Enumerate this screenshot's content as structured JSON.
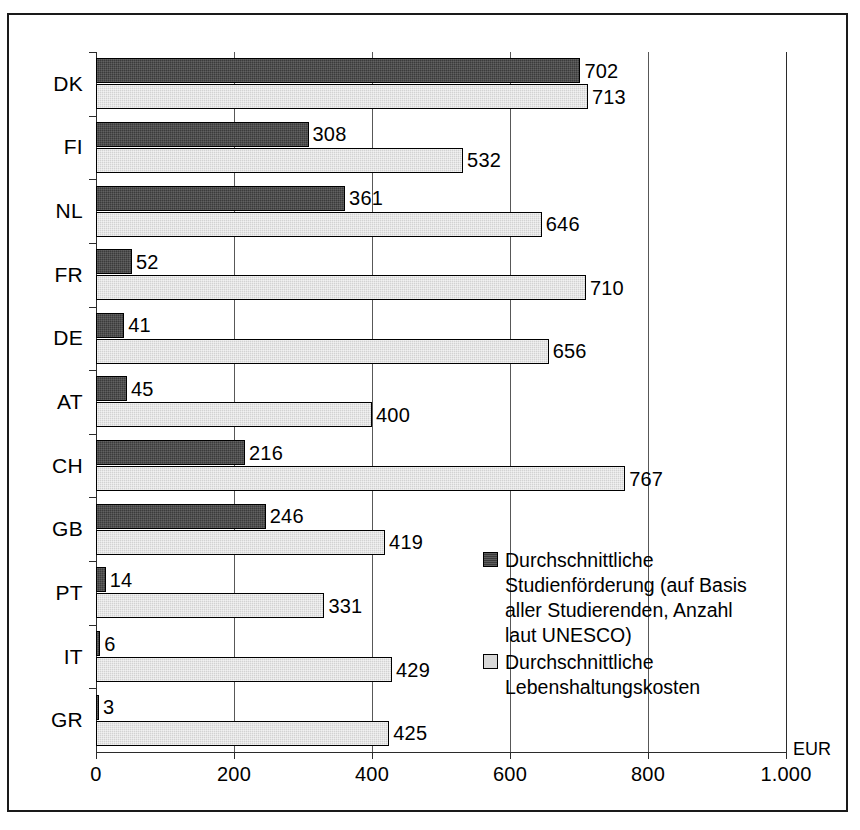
{
  "chart_data": {
    "type": "bar",
    "orientation": "horizontal",
    "title": "",
    "xlabel": "EUR",
    "ylabel": "",
    "xlim": [
      0,
      1000
    ],
    "xticks": [
      0,
      200,
      400,
      600,
      800,
      1000
    ],
    "xticklabels": [
      "0",
      "200",
      "400",
      "600",
      "800",
      "1.000"
    ],
    "grid": true,
    "grid_axis": "x",
    "legend_position": "inside-lower-right",
    "categories": [
      "DK",
      "FI",
      "NL",
      "FR",
      "DE",
      "AT",
      "CH",
      "GB",
      "PT",
      "IT",
      "GR"
    ],
    "series": [
      {
        "name": "Durchschnittliche Studienförderung (auf Basis aller Studierenden, Anzahl laut UNESCO)",
        "color": "#3b3b3b",
        "values": [
          702,
          308,
          361,
          52,
          41,
          45,
          216,
          246,
          14,
          6,
          3
        ]
      },
      {
        "name": "Durchschnittliche Lebenshaltungskosten",
        "color": "#d2d2d2",
        "values": [
          713,
          532,
          646,
          710,
          656,
          400,
          767,
          419,
          331,
          429,
          425
        ]
      }
    ]
  },
  "axis": {
    "unit_label": "EUR"
  },
  "legend": {
    "entries": [
      {
        "label": "Durchschnittliche Studienförderung (auf Basis aller Studierenden, Anzahl laut UNESCO)",
        "swatch": "dark-swatch-icon"
      },
      {
        "label": "Durchschnittliche Lebenshaltungskosten",
        "swatch": "light-swatch-icon"
      }
    ]
  },
  "colors": {
    "series_dark": "#3b3b3b",
    "series_light": "#d2d2d2",
    "frame": "#1a1a1a",
    "grid": "#585858"
  }
}
